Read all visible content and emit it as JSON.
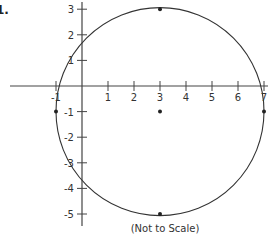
{
  "question_number": "1.",
  "caption": "(Not to Scale)",
  "axes": {
    "x_ticks": [
      -1,
      1,
      2,
      3,
      4,
      5,
      6,
      7
    ],
    "y_ticks": [
      3,
      2,
      1,
      -1,
      -2,
      -3,
      -4,
      -5
    ],
    "x_labels": [
      "-1",
      "1",
      "2",
      "3",
      "4",
      "5",
      "6",
      "7"
    ],
    "y_labels": [
      "3",
      "2",
      "1",
      "-1",
      "-2",
      "-3",
      "-4",
      "-5"
    ]
  },
  "circle": {
    "center": [
      3,
      -1
    ],
    "radius": 4
  },
  "points": [
    {
      "name": "top",
      "x": 3,
      "y": 3
    },
    {
      "name": "center",
      "x": 3,
      "y": -1
    },
    {
      "name": "bottom",
      "x": 3,
      "y": -5
    },
    {
      "name": "left",
      "x": -1,
      "y": -1
    },
    {
      "name": "right",
      "x": 7,
      "y": -1
    }
  ],
  "colors": {
    "stroke": "#333333",
    "background": "#ffffff"
  }
}
